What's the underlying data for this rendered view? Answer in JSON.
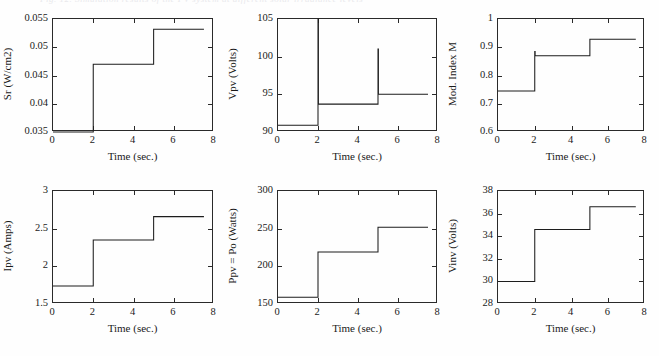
{
  "figure": {
    "background_color": "#fefefe",
    "line_color": "#1d1d1d",
    "axis_color": "#2a2a2a",
    "faded_caption": "Fig. 12. Simulation results of the PV system at different solar irradiance levels",
    "rows": 2,
    "cols": 3
  },
  "chart_data": [
    {
      "type": "line",
      "title": "",
      "id": "sr",
      "xlabel": "Time (sec.)",
      "ylabel": "Sr (W/cm2)",
      "xlim": [
        0,
        8
      ],
      "ylim": [
        0.035,
        0.055
      ],
      "xticks": [
        0,
        2,
        4,
        6,
        8
      ],
      "xticklabels": [
        "0",
        "2",
        "4",
        "6",
        "8"
      ],
      "yticks": [
        0.035,
        0.04,
        0.045,
        0.05,
        0.055
      ],
      "yticklabels": [
        "0.035",
        "0.04",
        "0.045",
        "0.05",
        "0.055"
      ],
      "grid": false,
      "legend": "none",
      "x": [
        0,
        2,
        2,
        5,
        5,
        7.5
      ],
      "y": [
        0.035,
        0.035,
        0.047,
        0.047,
        0.0532,
        0.0532
      ],
      "steps": [
        {
          "t_start": 0,
          "t_end": 2,
          "value": 0.035
        },
        {
          "t_start": 2,
          "t_end": 5,
          "value": 0.047
        },
        {
          "t_start": 5,
          "t_end": 7.5,
          "value": 0.0532
        }
      ]
    },
    {
      "type": "line",
      "title": "",
      "id": "vpv",
      "xlabel": "Time (sec.)",
      "ylabel": "Vpv (Volts)",
      "xlim": [
        0,
        8
      ],
      "ylim": [
        90,
        105
      ],
      "xticks": [
        0,
        2,
        4,
        6,
        8
      ],
      "xticklabels": [
        "0",
        "2",
        "4",
        "6",
        "8"
      ],
      "yticks": [
        90,
        95,
        100,
        105
      ],
      "yticklabels": [
        "90",
        "95",
        "100",
        "105"
      ],
      "grid": false,
      "legend": "none",
      "x": [
        0,
        2,
        2,
        2.02,
        2.02,
        5,
        5,
        5.02,
        5.02,
        7.5
      ],
      "y": [
        90.9,
        90.9,
        105,
        105,
        93.7,
        93.7,
        101,
        101,
        95,
        95
      ],
      "steps": [
        {
          "t_start": 0,
          "t_end": 2,
          "value": 90.9
        },
        {
          "t_start": 2,
          "t_end": 5,
          "value": 93.7
        },
        {
          "t_start": 5,
          "t_end": 7.5,
          "value": 95.0
        }
      ],
      "spikes": [
        {
          "t": 2,
          "peak": 105
        },
        {
          "t": 5,
          "peak": 101
        }
      ]
    },
    {
      "type": "line",
      "title": "",
      "id": "mod-index",
      "xlabel": "Time (sec.)",
      "ylabel": "Mod. Index M",
      "xlim": [
        0,
        8
      ],
      "ylim": [
        0.6,
        1
      ],
      "xticks": [
        0,
        2,
        4,
        6,
        8
      ],
      "xticklabels": [
        "0",
        "2",
        "4",
        "6",
        "8"
      ],
      "yticks": [
        0.6,
        0.7,
        0.8,
        0.9,
        1
      ],
      "yticklabels": [
        "0.6",
        "0.7",
        "0.8",
        "0.9",
        "1"
      ],
      "grid": false,
      "legend": "none",
      "x": [
        0,
        2,
        2,
        2.02,
        2.02,
        5,
        5,
        7.5
      ],
      "y": [
        0.745,
        0.745,
        0.885,
        0.885,
        0.87,
        0.87,
        0.928,
        0.928
      ],
      "steps": [
        {
          "t_start": 0,
          "t_end": 2,
          "value": 0.745
        },
        {
          "t_start": 2,
          "t_end": 5,
          "value": 0.87
        },
        {
          "t_start": 5,
          "t_end": 7.5,
          "value": 0.928
        }
      ],
      "spikes": [
        {
          "t": 2,
          "peak": 0.885
        }
      ]
    },
    {
      "type": "line",
      "title": "",
      "id": "ipv",
      "xlabel": "Time (sec.)",
      "ylabel": "Ipv (Amps)",
      "xlim": [
        0,
        8
      ],
      "ylim": [
        1.5,
        3
      ],
      "xticks": [
        0,
        2,
        4,
        6,
        8
      ],
      "xticklabels": [
        "0",
        "2",
        "4",
        "6",
        "8"
      ],
      "yticks": [
        1.5,
        2,
        2.5,
        3
      ],
      "yticklabels": [
        "1.5",
        "2",
        "2.5",
        "3"
      ],
      "grid": false,
      "legend": "none",
      "x": [
        0,
        2,
        2,
        5,
        5,
        7.5
      ],
      "y": [
        1.74,
        1.74,
        2.35,
        2.35,
        2.66,
        2.66
      ],
      "steps": [
        {
          "t_start": 0,
          "t_end": 2,
          "value": 1.74
        },
        {
          "t_start": 2,
          "t_end": 5,
          "value": 2.35
        },
        {
          "t_start": 5,
          "t_end": 7.5,
          "value": 2.66
        }
      ]
    },
    {
      "type": "line",
      "title": "",
      "id": "ppv",
      "xlabel": "Time (sec.)",
      "ylabel": "Ppv = Po (Watts)",
      "xlim": [
        0,
        8
      ],
      "ylim": [
        150,
        300
      ],
      "xticks": [
        0,
        2,
        4,
        6,
        8
      ],
      "xticklabels": [
        "0",
        "2",
        "4",
        "6",
        "8"
      ],
      "yticks": [
        150,
        200,
        250,
        300
      ],
      "yticklabels": [
        "150",
        "200",
        "250",
        "300"
      ],
      "grid": false,
      "legend": "none",
      "x": [
        0,
        2,
        2,
        5,
        5,
        7.5
      ],
      "y": [
        159,
        159,
        219,
        219,
        252,
        252
      ],
      "steps": [
        {
          "t_start": 0,
          "t_end": 2,
          "value": 159
        },
        {
          "t_start": 2,
          "t_end": 5,
          "value": 219
        },
        {
          "t_start": 5,
          "t_end": 7.5,
          "value": 252
        }
      ]
    },
    {
      "type": "line",
      "title": "",
      "id": "vinv",
      "xlabel": "Time (sec.)",
      "ylabel": "Vinv (Volts)",
      "xlim": [
        0,
        8
      ],
      "ylim": [
        28,
        38
      ],
      "xticks": [
        0,
        2,
        4,
        6,
        8
      ],
      "xticklabels": [
        "0",
        "2",
        "4",
        "6",
        "8"
      ],
      "yticks": [
        28,
        30,
        32,
        34,
        36,
        38
      ],
      "yticklabels": [
        "28",
        "30",
        "32",
        "34",
        "36",
        "38"
      ],
      "grid": false,
      "legend": "none",
      "x": [
        0,
        2,
        2,
        5,
        5,
        7.5
      ],
      "y": [
        30.0,
        30.0,
        34.6,
        34.6,
        36.6,
        36.6
      ],
      "steps": [
        {
          "t_start": 0,
          "t_end": 2,
          "value": 30.0
        },
        {
          "t_start": 2,
          "t_end": 5,
          "value": 34.6
        },
        {
          "t_start": 5,
          "t_end": 7.5,
          "value": 36.6
        }
      ]
    }
  ]
}
